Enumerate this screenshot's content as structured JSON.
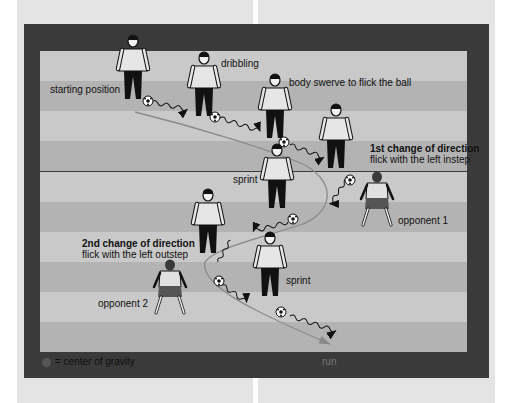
{
  "diagram": {
    "title_labels": {
      "starting_position": "starting position",
      "dribbling": "dribbling",
      "body_swerve": "body swerve to flick the ball",
      "first_change_title": "1st change of direction",
      "first_change_sub": "flick with the left instep",
      "sprint_1": "sprint",
      "opponent_1": "opponent 1",
      "second_change_title": "2nd change of direction",
      "second_change_sub": "flick with the left outstep",
      "opponent_2": "opponent 2",
      "sprint_2": "sprint"
    },
    "legend": {
      "symbol": "center-of-gravity-dot",
      "text": "= center of gravity"
    },
    "run_label": "run",
    "colors": {
      "frame": "#3a3a3a",
      "stripe_light": "#c9c9c9",
      "stripe_dark": "#b3b3b3",
      "path_line": "#8a8a8a",
      "shirt": "#e6e6e6",
      "pants": "#111111"
    },
    "stripes": [
      "light",
      "dark",
      "light",
      "dark",
      "light",
      "dark",
      "light",
      "dark",
      "light",
      "dark"
    ]
  }
}
